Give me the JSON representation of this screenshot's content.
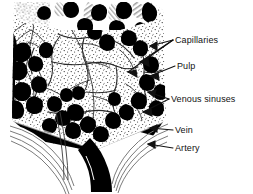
{
  "figure": {
    "colors": {
      "ink": "#000000",
      "background": "#ffffff",
      "stipple": "#1a1a1a",
      "grey_tissue": "#9a9a9a",
      "grey_light": "#c8c8c8",
      "line": "#2b2b2b"
    }
  },
  "labels": [
    {
      "id": "capillaries",
      "text": "Capillaries"
    },
    {
      "id": "pulp",
      "text": "Pulp"
    },
    {
      "id": "venous_sinuses",
      "text": "Venous sinuses"
    },
    {
      "id": "vein",
      "text": "Vein"
    },
    {
      "id": "artery",
      "text": "Artery"
    }
  ]
}
